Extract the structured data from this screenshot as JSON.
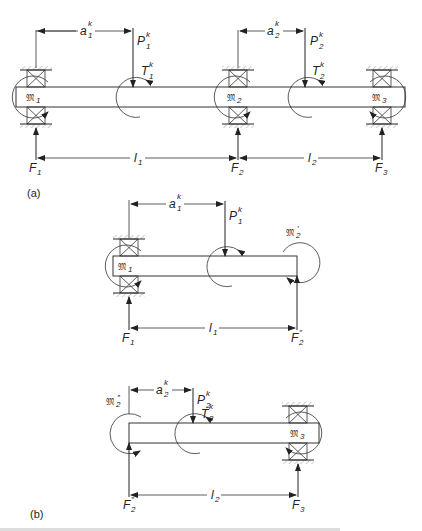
{
  "figure": {
    "panel_a": {
      "tag": "(a)",
      "dims": {
        "a1": {
          "base": "a",
          "sub": "1",
          "sup": "k"
        },
        "a2": {
          "base": "a",
          "sub": "2",
          "sup": "k"
        },
        "l1": {
          "base": "l",
          "sub": "1"
        },
        "l2": {
          "base": "l",
          "sub": "2"
        }
      },
      "loads": {
        "P1": {
          "base": "P",
          "sub": "1",
          "sup": "k"
        },
        "P2": {
          "base": "P",
          "sub": "2",
          "sup": "k"
        },
        "T1": {
          "base": "T",
          "sub": "1",
          "sup": "k"
        },
        "T2": {
          "base": "T",
          "sub": "2",
          "sup": "k"
        }
      },
      "reactions": {
        "F1": {
          "base": "F",
          "sub": "1"
        },
        "F2": {
          "base": "F",
          "sub": "2"
        },
        "F3": {
          "base": "F",
          "sub": "3"
        }
      },
      "moments": {
        "M1": {
          "base": "𝔐",
          "sub": "1"
        },
        "M2": {
          "base": "𝔐",
          "sub": "2"
        },
        "M3": {
          "base": "𝔐",
          "sub": "3"
        }
      }
    },
    "panel_b": {
      "tag": "(b)",
      "upper": {
        "a1": {
          "base": "a",
          "sub": "1",
          "sup": "k"
        },
        "P1": {
          "base": "P",
          "sub": "1",
          "sup": "k"
        },
        "l1": {
          "base": "l",
          "sub": "1"
        },
        "F1": {
          "base": "F",
          "sub": "1"
        },
        "F2pp": {
          "base": "F",
          "sub": "2",
          "sup": "″"
        },
        "M1": {
          "base": "𝔐",
          "sub": "1"
        },
        "M2p": {
          "base": "𝔐",
          "sub": "2",
          "sup": "′"
        }
      },
      "lower": {
        "a2": {
          "base": "a",
          "sub": "2",
          "sup": "k"
        },
        "P2": {
          "base": "P",
          "sub": "2",
          "sup": "k"
        },
        "T2": {
          "base": "T",
          "sub": "2",
          "sup": "k"
        },
        "l2": {
          "base": "l",
          "sub": "2"
        },
        "F2pp": {
          "base": "F",
          "sub": "2",
          "sup": "″"
        },
        "F3": {
          "base": "F",
          "sub": "3"
        },
        "M2pp": {
          "base": "𝔐",
          "sub": "2",
          "sup": "″"
        },
        "M3": {
          "base": "𝔐",
          "sub": "3"
        }
      }
    },
    "caption_partial": "(cut off caption text)"
  }
}
